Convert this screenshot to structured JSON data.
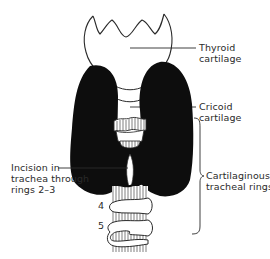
{
  "diagram": {
    "colors": {
      "ink": "#1a1a1a",
      "thyroid_gland": "#0d0d0d",
      "background": "#ffffff"
    },
    "labels": {
      "thyroid_cartilage": [
        "Thyroid",
        "cartilage"
      ],
      "cricoid_cartilage": [
        "Cricoid",
        "cartilage"
      ],
      "incision": [
        "Incision in",
        "trachea through",
        "rings 2–3"
      ],
      "tracheal_rings": [
        "Cartilaginous",
        "tracheal rings"
      ]
    },
    "ring_numbers": [
      "4",
      "5"
    ]
  }
}
